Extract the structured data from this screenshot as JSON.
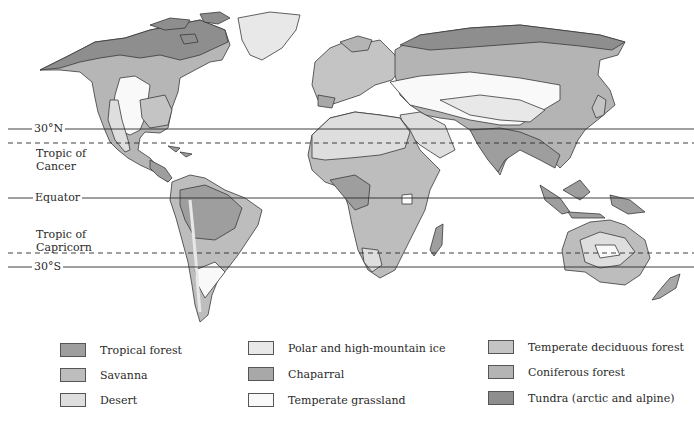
{
  "map": {
    "latitude_lines": [
      {
        "label": "30°N",
        "y": 129,
        "style": "solid"
      },
      {
        "label": "Tropic of Cancer",
        "label_line1": "Tropic of",
        "label_line2": "Cancer",
        "y": 143,
        "style": "dashed"
      },
      {
        "label": "Equator",
        "y": 198,
        "style": "solid"
      },
      {
        "label": "Tropic of Capricorn",
        "label_line1": "Tropic of",
        "label_line2": "Capricorn",
        "y": 253,
        "style": "dashed"
      },
      {
        "label": "30°S",
        "y": 267,
        "style": "solid"
      }
    ]
  },
  "legend": {
    "items": [
      {
        "label": "Tropical forest",
        "color": "#9e9e9e"
      },
      {
        "label": "Savanna",
        "color": "#bdbdbd"
      },
      {
        "label": "Desert",
        "color": "#dedede"
      },
      {
        "label": "Polar and high-mountain ice",
        "color": "#e8e8e8"
      },
      {
        "label": "Chaparral",
        "color": "#a8a8a8"
      },
      {
        "label": "Temperate grassland",
        "color": "#f9f9f9"
      },
      {
        "label": "Temperate deciduous forest",
        "color": "#c4c4c4"
      },
      {
        "label": "Coniferous forest",
        "color": "#b4b4b4"
      },
      {
        "label": "Tundra (arctic and alpine)",
        "color": "#8e8e8e"
      }
    ]
  }
}
